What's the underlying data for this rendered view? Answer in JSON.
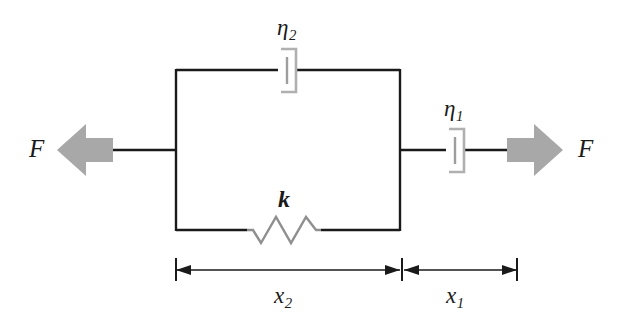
{
  "diagram": {
    "type": "mechanical-viscoelastic-model",
    "background_color": "#ffffff",
    "line_color": "#1a1a1a",
    "element_color": "#9a9a9a",
    "arrow_fill_color": "#a8a8a8",
    "labels": {
      "force_left": {
        "symbol": "F",
        "subscript": ""
      },
      "force_right": {
        "symbol": "F",
        "subscript": ""
      },
      "dashpot_top": {
        "symbol": "η",
        "subscript": "2"
      },
      "dashpot_right": {
        "symbol": "η",
        "subscript": "1"
      },
      "spring": {
        "symbol": "k",
        "subscript": ""
      },
      "dimension_left": {
        "symbol": "x",
        "subscript": "2"
      },
      "dimension_right": {
        "symbol": "x",
        "subscript": "1"
      }
    },
    "components": [
      {
        "name": "dashpot-eta2",
        "kind": "dashpot",
        "label": "η₂",
        "branch": "parallel-top"
      },
      {
        "name": "spring-k",
        "kind": "spring",
        "label": "k",
        "branch": "parallel-bottom",
        "coils": 4
      },
      {
        "name": "dashpot-eta1",
        "kind": "dashpot",
        "label": "η₁",
        "branch": "series-right"
      }
    ],
    "dimensions": [
      {
        "name": "x2",
        "label": "x₂",
        "spans": "parallel-block",
        "arrow_style": "double-headed"
      },
      {
        "name": "x1",
        "label": "x₁",
        "spans": "series-dashpot",
        "arrow_style": "double-headed"
      }
    ],
    "forces": [
      {
        "name": "force-left",
        "label": "F",
        "direction": "left"
      },
      {
        "name": "force-right",
        "label": "F",
        "direction": "right"
      }
    ]
  }
}
